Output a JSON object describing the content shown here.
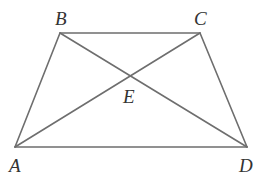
{
  "diagram": {
    "type": "trapezoid-with-diagonals",
    "line_color": "#6e6e6e",
    "label_color": "#333333",
    "points": {
      "A": {
        "x": 15,
        "y": 147,
        "label": "A",
        "label_x": 9,
        "label_y": 172
      },
      "B": {
        "x": 60,
        "y": 33,
        "label": "B",
        "label_x": 55,
        "label_y": 25
      },
      "C": {
        "x": 200,
        "y": 33,
        "label": "C",
        "label_x": 194,
        "label_y": 25
      },
      "D": {
        "x": 247,
        "y": 147,
        "label": "D",
        "label_x": 239,
        "label_y": 172
      },
      "E": {
        "x": 131,
        "y": 78,
        "label": "E",
        "label_x": 123,
        "label_y": 103
      }
    },
    "segments": [
      {
        "name": "BC",
        "from": "B",
        "to": "C"
      },
      {
        "name": "AD",
        "from": "A",
        "to": "D"
      },
      {
        "name": "AB",
        "from": "A",
        "to": "B"
      },
      {
        "name": "CD",
        "from": "C",
        "to": "D"
      },
      {
        "name": "AC",
        "from": "A",
        "to": "C"
      },
      {
        "name": "BD",
        "from": "B",
        "to": "D"
      }
    ]
  }
}
